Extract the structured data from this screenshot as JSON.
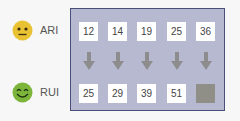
{
  "rows": [
    {
      "name": "ARI",
      "face": "neutral-face-icon",
      "face_color": "#e9c233",
      "values": [
        "12",
        "14",
        "19",
        "25",
        "36"
      ]
    },
    {
      "name": "RUI",
      "face": "smiling-face-icon",
      "face_color": "#7cb53a",
      "values": [
        "25",
        "29",
        "39",
        "51",
        ""
      ]
    }
  ],
  "arrows": 5,
  "colors": {
    "panel_bg": "#b7b9d1",
    "panel_border": "#4a4f7a",
    "arrow": "#8d8d8d",
    "blank_box": "#8f8f87"
  }
}
